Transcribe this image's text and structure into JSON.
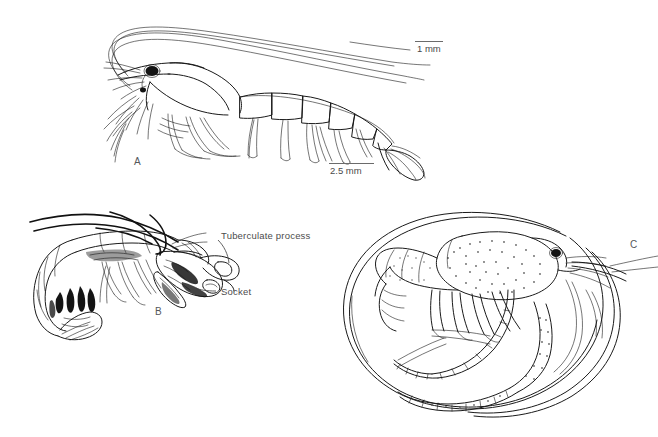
{
  "figure": {
    "kind": "scientific-line-drawing-plate",
    "background_color": "#ffffff",
    "ink_color": "#1a1a1a",
    "text_color": "#4c4c4c",
    "panels": [
      {
        "id": "A",
        "letter": "A",
        "subject": "shrimp larva, lateral view with long antennae",
        "letter_x": 134,
        "letter_y": 162
      },
      {
        "id": "B",
        "letter": "B",
        "subject": "snapping shrimp, lateral view with enlarged chela",
        "letter_x": 155,
        "letter_y": 312
      },
      {
        "id": "C",
        "letter": "C",
        "subject": "spiny lobster / scyllarid, lateral view with sweeping antennae",
        "letter_x": 630,
        "letter_y": 245
      }
    ],
    "annotations": [
      {
        "id": "tuberculate-process",
        "text": "Tuberculate process",
        "x": 221,
        "y": 236
      },
      {
        "id": "socket",
        "text": "Socket",
        "x": 221,
        "y": 292
      }
    ],
    "scale_bars": [
      {
        "id": "scale-1mm",
        "text": "1 mm",
        "x": 417,
        "y": 43,
        "rule_x": 415,
        "rule_y": 41,
        "rule_width": 28
      },
      {
        "id": "scale-2p5mm",
        "text": "2.5 mm",
        "x": 330,
        "y": 166,
        "rule_x": 329,
        "rule_y": 163,
        "rule_width": 45
      }
    ]
  }
}
